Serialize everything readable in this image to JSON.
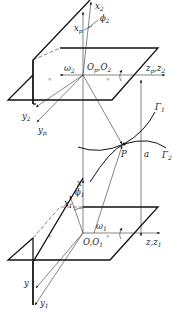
{
  "diagram": {
    "type": "gear meshing coordinate systems",
    "upper_system": {
      "origin_label": "O_p, O_2",
      "axes": {
        "x": "x_2",
        "x_alt": "x_p",
        "y": "y_2",
        "y_alt": "y_p",
        "z": "z_p, z_2"
      },
      "angle": "φ_2",
      "angular_velocity": "ω_2"
    },
    "lower_system": {
      "origin_label": "O, O_1",
      "axes": {
        "x": "x",
        "x_alt": "x_1",
        "y": "y",
        "y_alt": "y_1",
        "z": "z, z_1"
      },
      "angle": "φ_1",
      "angular_velocity": "ω_1"
    },
    "contact": {
      "point": "P",
      "curve_1": "Γ_1",
      "curve_2": "Γ_2",
      "center_distance": "a"
    }
  },
  "labels": {
    "x2": "x",
    "x2_sub": "2",
    "xp": "x",
    "xp_sub": "p",
    "phi2": "ϕ",
    "phi2_sub": "2",
    "omega2": "ω",
    "omega2_sub": "2",
    "Op": "O",
    "Op_sub": "p",
    "O2": "O",
    "O2_sub": "2",
    "zp": "z",
    "zp_sub": "p",
    "z2": "z",
    "z2_sub": "2",
    "y2": "y",
    "y2_sub": "2",
    "yp": "y",
    "yp_sub": "p",
    "Gamma1": "Γ",
    "Gamma1_sub": "1",
    "Gamma2": "Γ",
    "Gamma2_sub": "2",
    "P": "P",
    "a": "a",
    "x": "x",
    "x1": "x",
    "x1_sub": "1",
    "phi1": "ϕ",
    "phi1_sub": "1",
    "omega1": "ω",
    "omega1_sub": "1",
    "O": "O",
    "O1": "O",
    "O1_sub": "1",
    "z": "z",
    "z1": "z",
    "z1_sub": "1",
    "y": "y",
    "y1": "y",
    "y1_sub": "1",
    "comma": ","
  }
}
